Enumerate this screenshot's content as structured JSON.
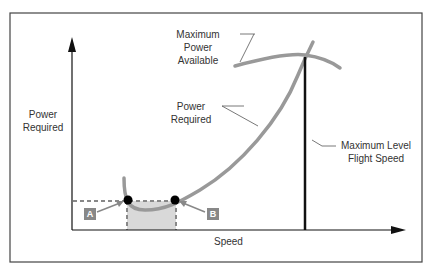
{
  "diagram": {
    "axes": {
      "y_label_line1": "Power",
      "y_label_line2": "Required",
      "x_label": "Speed"
    },
    "labels": {
      "max_power_line1": "Maximum",
      "max_power_line2": "Power",
      "max_power_line3": "Available",
      "power_required_line1": "Power",
      "power_required_line2": "Required",
      "max_level_line1": "Maximum Level",
      "max_level_line2": "Flight Speed"
    },
    "points": {
      "a": "A",
      "b": "B"
    },
    "colors": {
      "curve": "#999999",
      "axis": "#111111",
      "frame": "#444444",
      "shade": "#d9d9d9",
      "tag": "#888888"
    }
  }
}
